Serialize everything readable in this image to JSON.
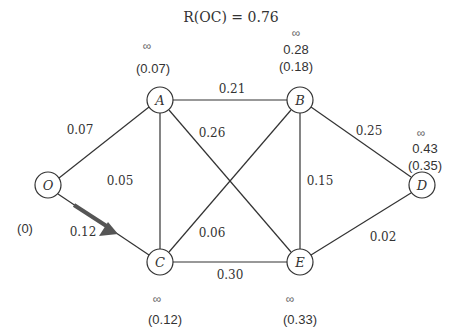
{
  "title": "R(OC) = 0.76",
  "nodes": [
    {
      "id": "O",
      "label": "O",
      "x": 48,
      "y": 185,
      "inf": "",
      "upper": "",
      "lower": "(0)"
    },
    {
      "id": "A",
      "label": "A",
      "x": 160,
      "y": 100,
      "inf": "∞",
      "upper": "",
      "lower": "(0.07)"
    },
    {
      "id": "B",
      "label": "B",
      "x": 300,
      "y": 100,
      "inf": "∞",
      "upper": "0.28",
      "lower": "(0.18)"
    },
    {
      "id": "C",
      "label": "C",
      "x": 160,
      "y": 262,
      "inf": "∞",
      "upper": "",
      "lower": "(0.12)"
    },
    {
      "id": "E",
      "label": "E",
      "x": 300,
      "y": 262,
      "inf": "∞",
      "upper": "",
      "lower": "(0.33)"
    },
    {
      "id": "D",
      "label": "D",
      "x": 422,
      "y": 185,
      "inf": "∞",
      "upper": "0.43",
      "lower": "(0.35)"
    }
  ],
  "edges": [
    {
      "from": "O",
      "to": "A",
      "weight": "0.07"
    },
    {
      "from": "O",
      "to": "C",
      "weight": "0.12",
      "highlighted": true
    },
    {
      "from": "A",
      "to": "B",
      "weight": "0.21"
    },
    {
      "from": "A",
      "to": "C",
      "weight": "0.05"
    },
    {
      "from": "A",
      "to": "E",
      "weight": "0.26"
    },
    {
      "from": "B",
      "to": "C",
      "weight": "0.06"
    },
    {
      "from": "B",
      "to": "E",
      "weight": "0.15"
    },
    {
      "from": "B",
      "to": "D",
      "weight": "0.25"
    },
    {
      "from": "C",
      "to": "E",
      "weight": "0.30"
    },
    {
      "from": "E",
      "to": "D",
      "weight": "0.02"
    }
  ],
  "colors": {
    "line": "#333333",
    "arrow": "#555555",
    "text": "#333333"
  }
}
